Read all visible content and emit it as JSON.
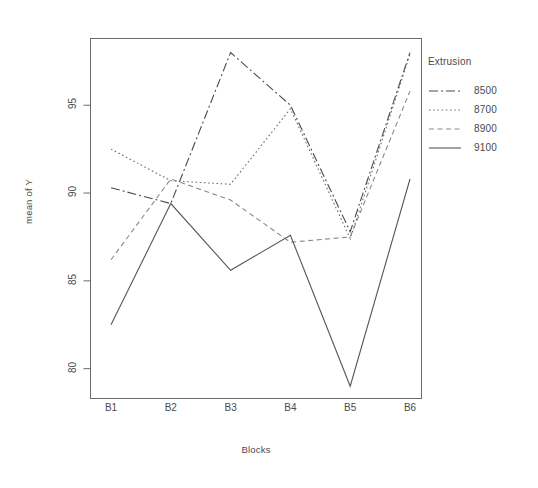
{
  "chart_data": {
    "type": "line",
    "title": "",
    "xlabel": "Blocks",
    "ylabel": "mean of Y",
    "categories": [
      "B1",
      "B2",
      "B3",
      "B4",
      "B5",
      "B6"
    ],
    "xtick_labels": [
      "B1",
      "B2",
      "B3",
      "B4",
      "B5",
      "B6"
    ],
    "ytick_labels": [
      "80",
      "85",
      "90",
      "95"
    ],
    "ytick_values": [
      80,
      85,
      90,
      95
    ],
    "ylim": [
      78.3,
      98.8
    ],
    "grid": false,
    "legend_position": "right",
    "legend_title": "Extrusion",
    "series": [
      {
        "name": "8500",
        "style": "dashdot",
        "color": "#4a4a4a",
        "values": [
          90.3,
          89.4,
          98.0,
          95.0,
          87.8,
          98.0
        ]
      },
      {
        "name": "8700",
        "style": "dotted",
        "color": "#6e6e6e",
        "values": [
          92.5,
          90.7,
          90.5,
          94.8,
          87.4,
          97.9
        ]
      },
      {
        "name": "8900",
        "style": "dashed",
        "color": "#8a8a8a",
        "values": [
          86.2,
          90.8,
          89.6,
          87.2,
          87.5,
          95.8
        ]
      },
      {
        "name": "9100",
        "style": "solid",
        "color": "#555555",
        "values": [
          82.5,
          89.4,
          85.6,
          87.6,
          79.0,
          90.8
        ]
      }
    ]
  },
  "legend": {
    "title": "Extrusion",
    "entries": [
      {
        "label": "8500"
      },
      {
        "label": "8700"
      },
      {
        "label": "8900"
      },
      {
        "label": "9100"
      }
    ]
  },
  "axes": {
    "y_title": "mean of Y",
    "x_title": "Blocks"
  }
}
